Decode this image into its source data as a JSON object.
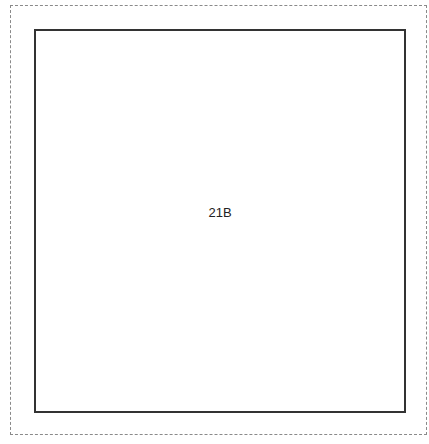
{
  "diagram": {
    "outer_border": {
      "style": "dashed",
      "color": "#8a8a8a"
    },
    "room": {
      "label": "21B",
      "border_color": "#333333"
    }
  }
}
